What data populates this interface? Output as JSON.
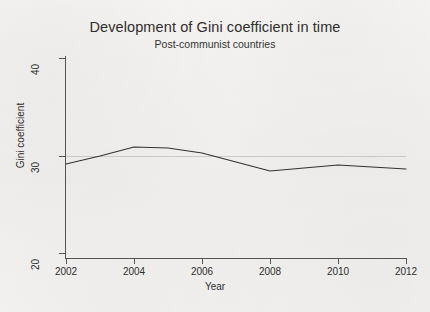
{
  "chart_data": {
    "type": "line",
    "title": "Development of Gini coefficient in time",
    "subtitle": "Post-communist countries",
    "xlabel": "Year",
    "ylabel": "Gini coefficient",
    "xlim": [
      2002,
      2012
    ],
    "ylim": [
      20,
      40
    ],
    "xticks": [
      2002,
      2004,
      2006,
      2008,
      2010,
      2012
    ],
    "xtick_labels": [
      "2002",
      "2004",
      "2006",
      "2008",
      "2010",
      "2012"
    ],
    "yticks": [
      20,
      30,
      40
    ],
    "ytick_labels": [
      "20",
      "30",
      "40"
    ],
    "grid": "faint horizontal gridline at y=30 only",
    "legend": "none",
    "line_color": "#333333",
    "background_color": "#f2f1ef",
    "axis_color": "#555555",
    "series": [
      {
        "name": "Gini coefficient",
        "x": [
          2002,
          2003,
          2004,
          2005,
          2006,
          2007,
          2008,
          2009,
          2010,
          2011,
          2012
        ],
        "values": [
          29.4,
          30.2,
          31.1,
          31.0,
          30.5,
          29.6,
          28.7,
          29.0,
          29.3,
          29.1,
          28.9
        ]
      }
    ]
  },
  "axes": {
    "y_title": "Gini coefficient",
    "x_title": "Year",
    "y_ticks": [
      {
        "label": "40",
        "value": 40
      },
      {
        "label": "30",
        "value": 30
      },
      {
        "label": "20",
        "value": 20
      }
    ],
    "x_ticks": [
      {
        "label": "2002",
        "value": 2002
      },
      {
        "label": "2004",
        "value": 2004
      },
      {
        "label": "2006",
        "value": 2006
      },
      {
        "label": "2008",
        "value": 2008
      },
      {
        "label": "2010",
        "value": 2010
      },
      {
        "label": "2012",
        "value": 2012
      }
    ]
  }
}
